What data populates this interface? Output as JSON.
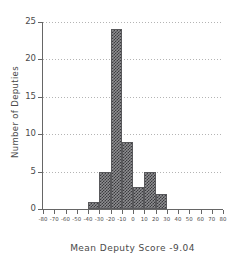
{
  "chart_data": {
    "type": "bar",
    "subtype": "histogram",
    "title": "",
    "xlabel": "Mean Deputy Score -9.04",
    "ylabel": "Number of Deputies",
    "xlim": [
      -80,
      80
    ],
    "ylim": [
      0,
      25
    ],
    "bin_width": 10,
    "grid": "horizontal-dotted",
    "legend": "none",
    "x_ticks": [
      -80,
      -70,
      -60,
      -50,
      -40,
      -30,
      -20,
      -10,
      0,
      10,
      20,
      30,
      40,
      50,
      60,
      70,
      80
    ],
    "x_tick_labels": [
      "-80",
      "-70",
      "-60",
      "-50",
      "-40",
      "-30",
      "-20",
      "-10",
      "0",
      "10",
      "20",
      "30",
      "40",
      "50",
      "60",
      "70",
      "80"
    ],
    "y_ticks": [
      0,
      5,
      10,
      15,
      20,
      25
    ],
    "y_tick_labels": [
      "0",
      "5",
      "10",
      "15",
      "20",
      "25"
    ],
    "bins": [
      {
        "left": -40,
        "right": -30,
        "count": 1
      },
      {
        "left": -30,
        "right": -20,
        "count": 5
      },
      {
        "left": -20,
        "right": -10,
        "count": 24
      },
      {
        "left": -10,
        "right": 0,
        "count": 9
      },
      {
        "left": 0,
        "right": 10,
        "count": 3
      },
      {
        "left": 10,
        "right": 20,
        "count": 5
      },
      {
        "left": 20,
        "right": 30,
        "count": 2
      }
    ],
    "categories": [
      "-40",
      "-30",
      "-20",
      "-10",
      "0",
      "10",
      "20"
    ],
    "values": [
      1,
      5,
      24,
      9,
      3,
      5,
      2
    ],
    "total_count": 49,
    "mean_label": "-9.04",
    "colors": {
      "bar_fill": "#8e8e91",
      "bar_pattern": "#3a3a3d",
      "bar_edge": "#59595c",
      "axis": "#666666",
      "grid": "#b4b4b4",
      "text": "#4a4a4a",
      "background": "#ffffff"
    }
  }
}
